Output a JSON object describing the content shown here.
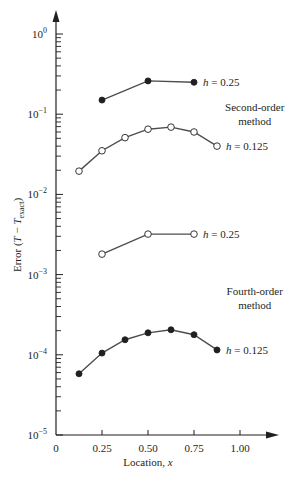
{
  "chart_data": {
    "type": "line",
    "title": "",
    "xlabel": "Location, x",
    "ylabel": "Error (T − T_exact)",
    "yscale": "log",
    "xlim": [
      0,
      1.25
    ],
    "ylim": [
      1e-05,
      1
    ],
    "x_ticks": [
      0,
      0.25,
      0.5,
      0.75,
      1.0
    ],
    "x_tick_labels": [
      "0",
      "0.25",
      "0.50",
      "0.75",
      "1.00"
    ],
    "y_ticks": [
      1,
      0.1,
      0.01,
      0.001,
      0.0001,
      1e-05
    ],
    "y_tick_labels": [
      {
        "base": "10",
        "exp": "0"
      },
      {
        "base": "10",
        "exp": "−1"
      },
      {
        "base": "10",
        "exp": "−2"
      },
      {
        "base": "10",
        "exp": "−3"
      },
      {
        "base": "10",
        "exp": "−4"
      },
      {
        "base": "10",
        "exp": "−5"
      }
    ],
    "grid": false,
    "legend": "none (inline annotations)",
    "series": [
      {
        "name": "Second-order, h = 0.25",
        "method": "Second-order",
        "marker": "filled",
        "label": "h = 0.25",
        "x": [
          0.25,
          0.5,
          0.75
        ],
        "y": [
          0.15,
          0.26,
          0.25
        ]
      },
      {
        "name": "Second-order, h = 0.125",
        "method": "Second-order",
        "marker": "open",
        "label": "h = 0.125",
        "x": [
          0.125,
          0.25,
          0.375,
          0.5,
          0.625,
          0.75,
          0.875
        ],
        "y": [
          0.0195,
          0.035,
          0.051,
          0.065,
          0.069,
          0.06,
          0.04
        ]
      },
      {
        "name": "Fourth-order, h = 0.25",
        "method": "Fourth-order",
        "marker": "open",
        "label": "h = 0.25",
        "x": [
          0.25,
          0.5,
          0.75
        ],
        "y": [
          0.0018,
          0.0032,
          0.0032
        ]
      },
      {
        "name": "Fourth-order, h = 0.125",
        "method": "Fourth-order",
        "marker": "filled",
        "label": "h = 0.125",
        "x": [
          0.125,
          0.25,
          0.375,
          0.5,
          0.625,
          0.75,
          0.875
        ],
        "y": [
          5.8e-05,
          0.000105,
          0.000154,
          0.000188,
          0.000205,
          0.000178,
          0.000115
        ]
      }
    ],
    "annotations": [
      {
        "text": [
          "Second-order",
          "method"
        ],
        "x": 1.08,
        "y": 0.11
      },
      {
        "text": [
          "Fourth-order",
          "method"
        ],
        "x": 1.08,
        "y": 0.00055
      }
    ]
  },
  "colors": {
    "ink": "#231f20",
    "line": "#4d4d4d",
    "background": "#ffffff"
  }
}
